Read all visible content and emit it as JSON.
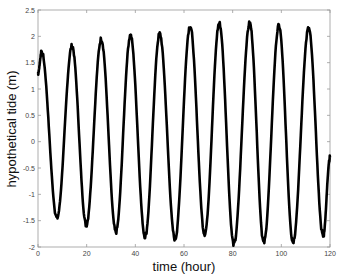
{
  "chart_data": {
    "type": "line",
    "title": "",
    "xlabel": "time (hour)",
    "ylabel": "hypothetical tide (m)",
    "xlim": [
      0,
      120
    ],
    "ylim": [
      -2,
      2.5
    ],
    "xticks": [
      0,
      20,
      40,
      60,
      80,
      100,
      120
    ],
    "xtick_labels": [
      "0",
      "20",
      "40",
      "60",
      "80",
      "100",
      "120"
    ],
    "yticks": [
      -2,
      -1.5,
      -1,
      -0.5,
      0,
      0.5,
      1,
      1.5,
      2,
      2.5
    ],
    "ytick_labels": [
      "-2",
      "-1.5",
      "-1",
      "-0.5",
      "0",
      "0.5",
      "1",
      "1.5",
      "2",
      "2.5"
    ],
    "grid": false,
    "legend": null,
    "line_color": "#000000",
    "series": [
      {
        "name": "hypothetical tide",
        "description": "semidiurnal oscillation (~12.4 h period), amplitude growing over time",
        "keypoints_x": [
          0,
          1.5,
          7.8,
          14,
          19.8,
          26,
          32,
          38,
          44,
          50,
          56.3,
          62.5,
          68.5,
          74.5,
          80.5,
          87,
          92.8,
          99,
          104.8,
          111.2,
          117.2,
          120
        ],
        "keypoints_y": [
          1.3,
          1.7,
          -1.45,
          1.82,
          -1.58,
          1.95,
          -1.72,
          2.02,
          -1.8,
          2.05,
          -1.85,
          2.2,
          -1.75,
          2.25,
          -1.95,
          2.25,
          -1.92,
          2.2,
          -1.9,
          2.15,
          -1.8,
          -0.3
        ]
      }
    ]
  }
}
